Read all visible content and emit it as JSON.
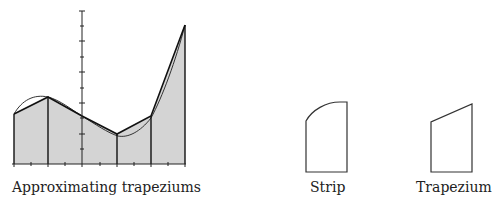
{
  "figure": {
    "panels": [
      {
        "id": "main",
        "caption": "Approximating trapeziums"
      },
      {
        "id": "strip",
        "caption": "Strip"
      },
      {
        "id": "trapezium",
        "caption": "Trapezium"
      }
    ],
    "colors": {
      "fill": "#d4d4d4",
      "stroke": "#222222",
      "background": "#ffffff"
    },
    "main_graph": {
      "strip_count": 5,
      "x_ticks_per_strip": 2,
      "y_axis_ticks": 10
    }
  }
}
